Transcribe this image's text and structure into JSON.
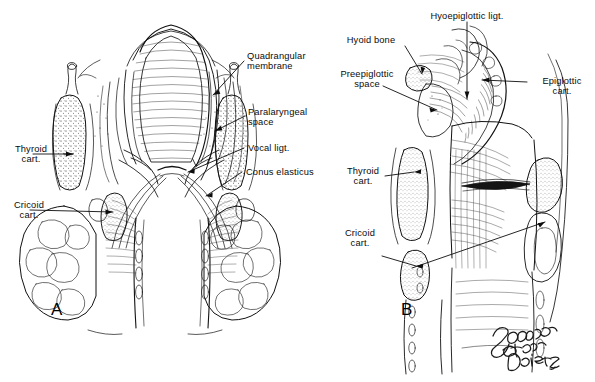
{
  "figure": {
    "background_color": "#ffffff",
    "ink_color": "#111111",
    "panels": [
      {
        "id": "A",
        "letter": "A",
        "view": "coronal section of larynx"
      },
      {
        "id": "B",
        "letter": "B",
        "view": "sagittal section of larynx"
      }
    ]
  },
  "panel_a": {
    "letter": "A",
    "labels": [
      {
        "key": "quadrangular_membrane",
        "text": "Quadrangular\nmembrane",
        "align": "left"
      },
      {
        "key": "paralaryngeal_space",
        "text": "Paralaryngeal\nspace",
        "align": "left"
      },
      {
        "key": "vocal_ligament",
        "text": "Vocal ligt.",
        "align": "left"
      },
      {
        "key": "conus_elasticus",
        "text": "Conus elasticus",
        "align": "left"
      },
      {
        "key": "thyroid_cart",
        "text": "Thyroid\ncart.",
        "align": "center"
      },
      {
        "key": "cricoid_cart",
        "text": "Cricoid\ncart.",
        "align": "center"
      }
    ]
  },
  "panel_b": {
    "letter": "B",
    "labels": [
      {
        "key": "hyoepiglottic_ligament",
        "text": "Hyoepiglottic ligt.",
        "align": "center"
      },
      {
        "key": "hyoid_bone",
        "text": "Hyoid bone",
        "align": "center"
      },
      {
        "key": "preepiglottic_space",
        "text": "Preepiglottic\nspace",
        "align": "center"
      },
      {
        "key": "epiglottic_cart",
        "text": "Epiglottic\ncart.",
        "align": "center"
      },
      {
        "key": "thyroid_cart",
        "text": "Thyroid\ncart.",
        "align": "center"
      },
      {
        "key": "cricoid_cart",
        "text": "Cricoid\ncart.",
        "align": "center"
      }
    ]
  },
  "signature": {
    "text": "George after Dietz",
    "style": "handwritten artist signature"
  }
}
